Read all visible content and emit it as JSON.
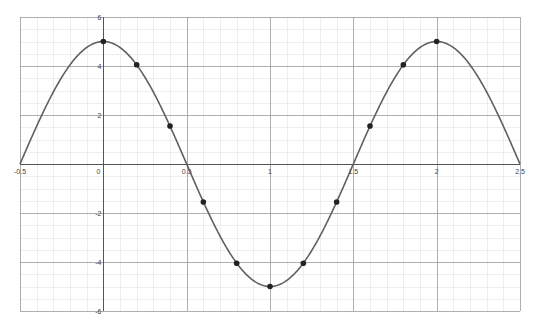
{
  "chart_data": {
    "type": "line",
    "title": "",
    "xlabel": "",
    "ylabel": "",
    "function": "y = 5cos(πx)",
    "xlim": [
      -0.5,
      2.5
    ],
    "ylim": [
      -6,
      6
    ],
    "grid": true,
    "legend": null,
    "x_ticks": [
      -0.5,
      0,
      0.5,
      1,
      1.5,
      2,
      2.5
    ],
    "x_tick_labels": [
      "-0.5",
      "0",
      "0.5",
      "1",
      "1.5",
      "2",
      "2.5"
    ],
    "y_ticks": [
      6,
      4,
      2,
      -2,
      -4,
      -6
    ],
    "y_tick_labels": [
      "6",
      "4",
      "2",
      "-2",
      "-4",
      "-6"
    ],
    "series": [
      {
        "name": "curve",
        "x": [
          -0.5,
          0,
          0.5,
          1,
          1.5,
          2,
          2.5
        ],
        "y": [
          0,
          5,
          0,
          -5,
          0,
          5,
          0
        ]
      },
      {
        "name": "points",
        "x": [
          0,
          0.2,
          0.4,
          0.6,
          0.8,
          1,
          1.2,
          1.4,
          1.6,
          1.8,
          2
        ],
        "y": [
          5,
          4.05,
          1.55,
          -1.55,
          -4.05,
          -5,
          -4.05,
          -1.55,
          1.55,
          4.05,
          5
        ]
      }
    ],
    "colors": {
      "curve": "#606060",
      "points": "#222222",
      "axis": "#555555",
      "major_grid": "#9a9a9a",
      "minor_grid": "#e2e2e2"
    }
  }
}
